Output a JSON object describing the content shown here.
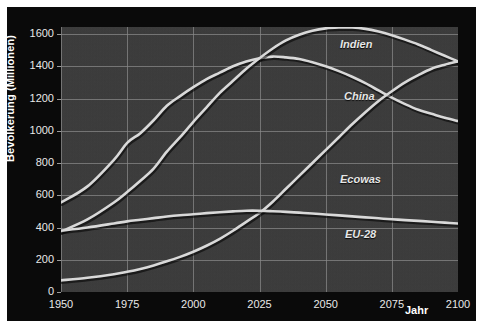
{
  "chart_data": {
    "type": "line",
    "title": "",
    "xlabel": "Jahr",
    "ylabel": "Bevölkerung (Millionen)",
    "xlim": [
      1950,
      2100
    ],
    "ylim": [
      0,
      1700
    ],
    "grid": true,
    "legend_position": "inline-labels",
    "background": "#3a3a3a",
    "line_color": "#d9d9d9",
    "text_color": "#e8e8e8",
    "xticks": [
      1950,
      1975,
      2000,
      2025,
      2050,
      2075,
      2100
    ],
    "xtick_labels": [
      "1950",
      "1975",
      "2000",
      "2025",
      "2050",
      "2075",
      "2100"
    ],
    "yticks": [
      0,
      200,
      400,
      600,
      800,
      1000,
      1200,
      1400,
      1600
    ],
    "ytick_labels": [
      "0",
      "200",
      "400",
      "600",
      "800",
      "1000",
      "1200",
      "1400",
      "1600"
    ],
    "x": [
      1950,
      1960,
      1970,
      1975,
      1980,
      1985,
      1990,
      1995,
      2000,
      2005,
      2010,
      2015,
      2020,
      2025,
      2030,
      2035,
      2040,
      2045,
      2050,
      2055,
      2060,
      2065,
      2070,
      2075,
      2080,
      2085,
      2090,
      2095,
      2100
    ],
    "series": [
      {
        "name": "China",
        "label": "China",
        "values": [
          555,
          655,
          820,
          925,
          985,
          1065,
          1155,
          1215,
          1270,
          1320,
          1360,
          1400,
          1430,
          1450,
          1460,
          1455,
          1445,
          1425,
          1400,
          1370,
          1335,
          1295,
          1250,
          1205,
          1165,
          1130,
          1105,
          1080,
          1060
        ]
      },
      {
        "name": "Indien",
        "label": "Indien",
        "values": [
          375,
          450,
          555,
          620,
          690,
          765,
          870,
          960,
          1055,
          1145,
          1235,
          1310,
          1385,
          1450,
          1510,
          1560,
          1595,
          1620,
          1635,
          1640,
          1640,
          1632,
          1615,
          1592,
          1565,
          1535,
          1500,
          1465,
          1430
        ]
      },
      {
        "name": "Ecowas",
        "label": "Ecowas",
        "values": [
          72,
          88,
          110,
          125,
          143,
          165,
          190,
          218,
          250,
          287,
          330,
          380,
          435,
          490,
          560,
          640,
          720,
          800,
          880,
          960,
          1040,
          1115,
          1185,
          1245,
          1300,
          1345,
          1385,
          1410,
          1430
        ]
      },
      {
        "name": "EU-28",
        "label": "EU-28",
        "values": [
          380,
          400,
          425,
          438,
          448,
          458,
          468,
          476,
          482,
          489,
          495,
          500,
          504,
          504,
          501,
          497,
          492,
          487,
          481,
          475,
          469,
          463,
          457,
          451,
          446,
          441,
          436,
          430,
          425
        ]
      }
    ],
    "series_labels": [
      {
        "name": "Indien",
        "x_px": 333,
        "y_px": 31
      },
      {
        "name": "China",
        "x_px": 337,
        "y_px": 83
      },
      {
        "name": "Ecowas",
        "x_px": 333,
        "y_px": 166
      },
      {
        "name": "EU-28",
        "x_px": 338,
        "y_px": 221
      }
    ]
  }
}
